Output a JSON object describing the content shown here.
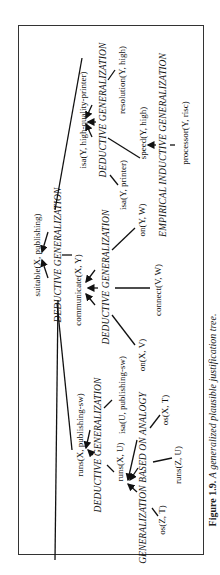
{
  "figure": {
    "caption_number": "Figure 1.9.",
    "caption_text": "A generalized plausible justification tree.",
    "orientation": "rotated 90° counter-clockwise"
  },
  "nodes": {
    "root": {
      "label": "suitable(X, publishing)"
    },
    "root_rule": {
      "label": "DEDUCTIVE GENERALIZATION"
    },
    "isa_hqp": {
      "label": "isa(Y, high-quality-printer)"
    },
    "hqp_rule": {
      "label": "DEDUCTIVE GENERALIZATION"
    },
    "resolution": {
      "label": "resolution(Y, high)"
    },
    "isa_printer": {
      "label": "isa(Y, printer)"
    },
    "speed": {
      "label": "speed(Y, high)"
    },
    "speed_rule": {
      "label": "EMPIRICAL INDUCTIVE GENERALIZATION"
    },
    "processor": {
      "label": "processor(Y, risc)"
    },
    "communicate": {
      "label": "communicate(X, Y)"
    },
    "comm_rule": {
      "label": "DEDUCTIVE GENERALIZATION"
    },
    "on_yw": {
      "label": "on(Y, W)"
    },
    "connect": {
      "label": "connect(V, W)"
    },
    "on_xv": {
      "label": "on(X, V)"
    },
    "runs_pub": {
      "label": "runs(X, publishing-sw)"
    },
    "runs_pub_rule": {
      "label": "DEDUCTIVE GENERALIZATION"
    },
    "isa_pubsw": {
      "label": "isa(U, publishing-sw)"
    },
    "runs_xu": {
      "label": "runs(X, U)"
    },
    "analogy_rule": {
      "label": "GENERALIZATION BASED ON ANALOGY"
    },
    "os_xt": {
      "label": "os(X, T)"
    },
    "runs_zu": {
      "label": "runs(Z, U)"
    },
    "os_zt": {
      "label": "os(Z, T)"
    }
  },
  "edges": [
    [
      "root",
      "isa_hqp"
    ],
    [
      "root",
      "communicate"
    ],
    [
      "root",
      "runs_pub"
    ],
    [
      "isa_hqp",
      "isa_printer"
    ],
    [
      "isa_hqp",
      "speed"
    ],
    [
      "isa_hqp",
      "resolution"
    ],
    [
      "speed",
      "processor"
    ],
    [
      "communicate",
      "on_yw"
    ],
    [
      "communicate",
      "connect"
    ],
    [
      "communicate",
      "on_xv"
    ],
    [
      "runs_pub",
      "isa_pubsw"
    ],
    [
      "runs_pub",
      "runs_xu"
    ],
    [
      "runs_xu",
      "os_xt"
    ],
    [
      "runs_xu",
      "runs_zu"
    ],
    [
      "runs_xu",
      "os_zt"
    ]
  ],
  "colors": {
    "ink": "#111111",
    "frame": "#333333",
    "background": "#ffffff"
  }
}
